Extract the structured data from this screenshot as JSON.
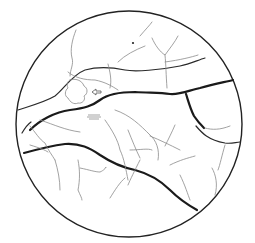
{
  "map": {
    "shape": "circle",
    "colors": {
      "background": "#ffffff",
      "major_line": "#1a1a1a",
      "minor_line": "#8a8a8a",
      "border": "#222222"
    },
    "markers": [
      {
        "name": "arrow-marker",
        "direction": "left"
      },
      {
        "name": "hatch-marker"
      },
      {
        "name": "dot-marker"
      }
    ]
  }
}
